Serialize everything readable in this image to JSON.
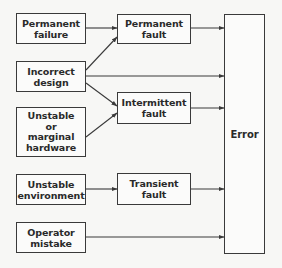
{
  "diagram": {
    "causes": [
      {
        "id": "permanent-failure",
        "lines": [
          "Permanent",
          "failure"
        ]
      },
      {
        "id": "incorrect-design",
        "lines": [
          "Incorrect",
          "design"
        ]
      },
      {
        "id": "unstable-hardware",
        "lines": [
          "Unstable",
          "or",
          "marginal",
          "hardware"
        ]
      },
      {
        "id": "unstable-environment",
        "lines": [
          "Unstable",
          "environment"
        ]
      },
      {
        "id": "operator-mistake",
        "lines": [
          "Operator",
          "mistake"
        ]
      }
    ],
    "faults": [
      {
        "id": "permanent-fault",
        "lines": [
          "Permanent",
          "fault"
        ]
      },
      {
        "id": "intermittent-fault",
        "lines": [
          "Intermittent",
          "fault"
        ]
      },
      {
        "id": "transient-fault",
        "lines": [
          "Transient",
          "fault"
        ]
      }
    ],
    "result": {
      "id": "error",
      "label": "Error"
    },
    "edges": [
      {
        "from": "permanent-failure",
        "to": "permanent-fault"
      },
      {
        "from": "incorrect-design",
        "to": "permanent-fault"
      },
      {
        "from": "incorrect-design",
        "to": "error"
      },
      {
        "from": "incorrect-design",
        "to": "intermittent-fault"
      },
      {
        "from": "unstable-hardware",
        "to": "intermittent-fault"
      },
      {
        "from": "unstable-environment",
        "to": "transient-fault"
      },
      {
        "from": "operator-mistake",
        "to": "error"
      },
      {
        "from": "permanent-fault",
        "to": "error"
      },
      {
        "from": "intermittent-fault",
        "to": "error"
      },
      {
        "from": "transient-fault",
        "to": "error"
      }
    ],
    "colors": {
      "line": "#3a3a3a",
      "background": "#f7f7f5"
    }
  }
}
